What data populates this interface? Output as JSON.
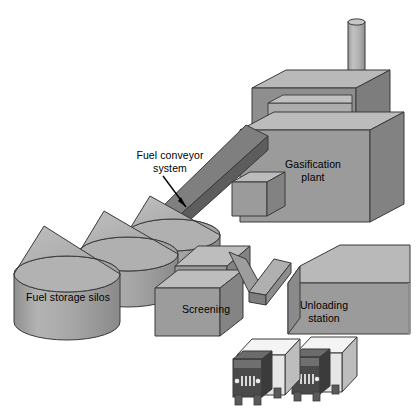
{
  "diagram": {
    "view": "isometric",
    "background_color": "#ffffff",
    "labels": {
      "fuel_conveyor": "Fuel conveyor\nsystem",
      "gasification_plant": "Gasification\nplant",
      "fuel_storage_silos": "Fuel storage silos",
      "screening": "Screening",
      "unloading_station": "Unloading\nstation"
    },
    "palette": {
      "face_front": "#9b9b9b",
      "face_top": "#b4b4b4",
      "face_side": "#868686",
      "face_light": "#c3c3c3",
      "conveyor_dark": "#5d5d5d",
      "conveyor_mid": "#6e6e6e",
      "outline": "#3a3a3a",
      "truck_cab": "#4a4a4a",
      "truck_trailer": "#f2f2f2",
      "truck_trailer_side": "#bdbdbd",
      "text": "#000000"
    },
    "components": [
      {
        "name": "fuel-storage-silos",
        "label": "Fuel storage silos",
        "type": "cylindrical-silo-group",
        "count": 3
      },
      {
        "name": "screening-building",
        "label": "Screening",
        "type": "building-block"
      },
      {
        "name": "unloading-station",
        "label": "Unloading station",
        "type": "building-block"
      },
      {
        "name": "gasification-plant",
        "label": "Gasification plant",
        "type": "building-block-with-stack"
      },
      {
        "name": "fuel-conveyor-system",
        "label": "Fuel conveyor system",
        "type": "inclined-conveyor"
      },
      {
        "name": "truck",
        "label": "",
        "type": "delivery-truck",
        "count": 2
      },
      {
        "name": "smokestack",
        "label": "",
        "type": "chimney"
      }
    ]
  }
}
